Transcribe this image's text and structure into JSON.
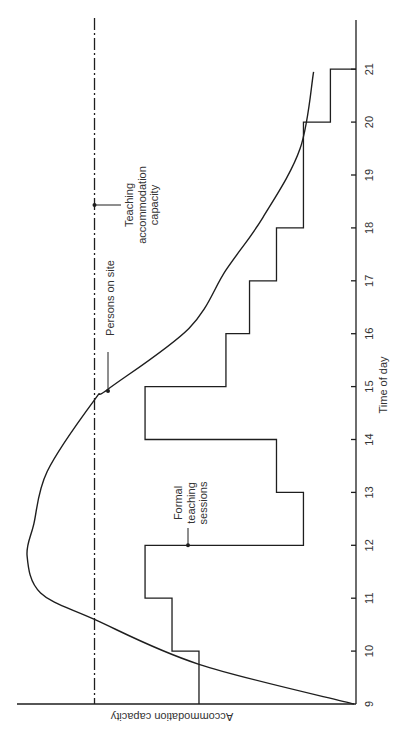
{
  "chart_data": {
    "type": "line",
    "orientation": "rotated-90-clockwise",
    "title": "",
    "xlabel": "Time of day",
    "ylabel": "Accommodation capacity",
    "xlim": [
      9,
      21
    ],
    "x_ticks": [
      9,
      10,
      11,
      12,
      13,
      14,
      15,
      16,
      17,
      18,
      19,
      20,
      21
    ],
    "ylim": [
      0,
      100
    ],
    "grid": false,
    "legend": "none (inline annotations)",
    "series": [
      {
        "name": "Persons on site",
        "style": "solid smooth curve",
        "points": [
          [
            9.0,
            0
          ],
          [
            9.75,
            46
          ],
          [
            10.6,
            77
          ],
          [
            11.1,
            93
          ],
          [
            11.8,
            97
          ],
          [
            12.4,
            95
          ],
          [
            13.4,
            91
          ],
          [
            14.75,
            77
          ],
          [
            14.95,
            73
          ],
          [
            16.1,
            49
          ],
          [
            17.2,
            38
          ],
          [
            18.2,
            27
          ],
          [
            19.5,
            16
          ],
          [
            20.95,
            12
          ]
        ]
      },
      {
        "name": "Formal teaching sessions",
        "style": "step",
        "steps": [
          {
            "from": 9,
            "to": 10,
            "value": 46
          },
          {
            "from": 10,
            "to": 11,
            "value": 54
          },
          {
            "from": 11,
            "to": 12,
            "value": 62
          },
          {
            "from": 12,
            "to": 13,
            "value": 15
          },
          {
            "from": 13,
            "to": 14,
            "value": 23
          },
          {
            "from": 14,
            "to": 15,
            "value": 62
          },
          {
            "from": 15,
            "to": 16,
            "value": 38
          },
          {
            "from": 16,
            "to": 17,
            "value": 31
          },
          {
            "from": 17,
            "to": 18,
            "value": 23
          },
          {
            "from": 18,
            "to": 20,
            "value": 15
          },
          {
            "from": 20,
            "to": 21,
            "value": 7
          }
        ]
      },
      {
        "name": "Teaching accommodation capacity",
        "style": "dash-dot horizontal line",
        "value": 77
      }
    ],
    "annotations": [
      {
        "text": [
          "Teaching",
          "accommodation",
          "capacity"
        ],
        "at": [
          18.5,
          77
        ]
      },
      {
        "text": [
          "Persons on site"
        ],
        "at": [
          14.95,
          73
        ]
      },
      {
        "text": [
          "Formal",
          "teaching",
          "sessions"
        ],
        "at": [
          12.0,
          54
        ]
      }
    ]
  },
  "labels": {
    "xlabel": "Time of day",
    "ylabel": "Accommodation capacity",
    "capacity": [
      "Teaching",
      "accommodation",
      "capacity"
    ],
    "persons": "Persons on site",
    "sessions": [
      "Formal",
      "teaching",
      "sessions"
    ]
  },
  "colors": {
    "line": "#1e1e1e",
    "text": "#333333",
    "background": "#ffffff"
  }
}
